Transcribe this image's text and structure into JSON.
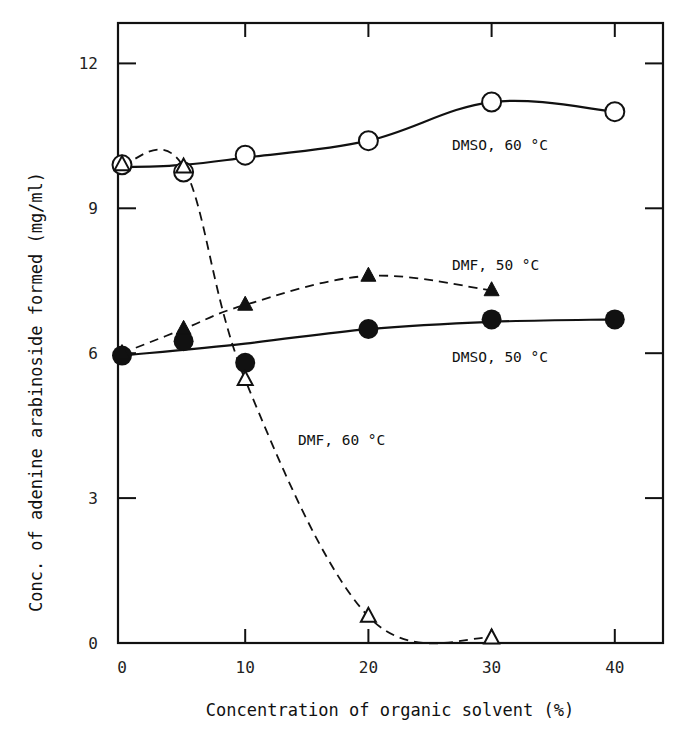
{
  "chart_data": {
    "type": "line",
    "title": "",
    "xlabel": "Concentration of organic solvent (%)",
    "ylabel": "Conc. of adenine arabinoside formed (mg/ml)",
    "xlim": [
      0,
      43
    ],
    "ylim": [
      0,
      12.8
    ],
    "xticks": [
      0,
      10,
      20,
      30,
      40
    ],
    "yticks": [
      0,
      3,
      6,
      9,
      12
    ],
    "xtick_labels": [
      "0",
      "10",
      "20",
      "30",
      "40"
    ],
    "ytick_labels": [
      "0",
      "3",
      "6",
      "9",
      "12"
    ],
    "grid": false,
    "legend": "inline labels",
    "series": [
      {
        "name": "DMSO, 60 °C",
        "marker": "open-circle",
        "line": "solid",
        "x": [
          0,
          5,
          10,
          20,
          30,
          40
        ],
        "y": [
          9.9,
          9.75,
          10.1,
          10.4,
          11.2,
          11.0
        ]
      },
      {
        "name": "DMSO, 50 °C",
        "marker": "filled-circle",
        "line": "solid",
        "x": [
          0,
          5,
          10,
          20,
          30,
          40
        ],
        "y": [
          5.95,
          6.25,
          5.8,
          6.5,
          6.7,
          6.7
        ]
      },
      {
        "name": "DMF, 50 °C",
        "marker": "filled-triangle",
        "line": "dashed",
        "x": [
          0,
          5,
          10,
          20,
          30
        ],
        "y": [
          6.0,
          6.5,
          7.0,
          7.6,
          7.3
        ]
      },
      {
        "name": "DMF, 60 °C",
        "marker": "open-triangle",
        "line": "dashed",
        "x": [
          0,
          5,
          10,
          20,
          30
        ],
        "y": [
          9.9,
          9.85,
          5.45,
          0.55,
          0.1
        ]
      }
    ],
    "annotations": [
      {
        "text": "DMSO, 60 °C",
        "x": 27,
        "y": 10.0
      },
      {
        "text": "DMF, 50 °C",
        "x": 27,
        "y": 7.8
      },
      {
        "text": "DMSO, 50 °C",
        "x": 30,
        "y": 6.0
      },
      {
        "text": "DMF, 60 °C",
        "x": 15,
        "y": 4.2
      }
    ]
  },
  "labels": {
    "xlabel": "Concentration of organic solvent (%)",
    "ylabel": "Conc. of adenine arabinoside formed (mg/ml)",
    "dmso60": "DMSO, 60 °C",
    "dmf50": "DMF, 50 °C",
    "dmso50": "DMSO, 50 °C",
    "dmf60": "DMF, 60 °C"
  }
}
